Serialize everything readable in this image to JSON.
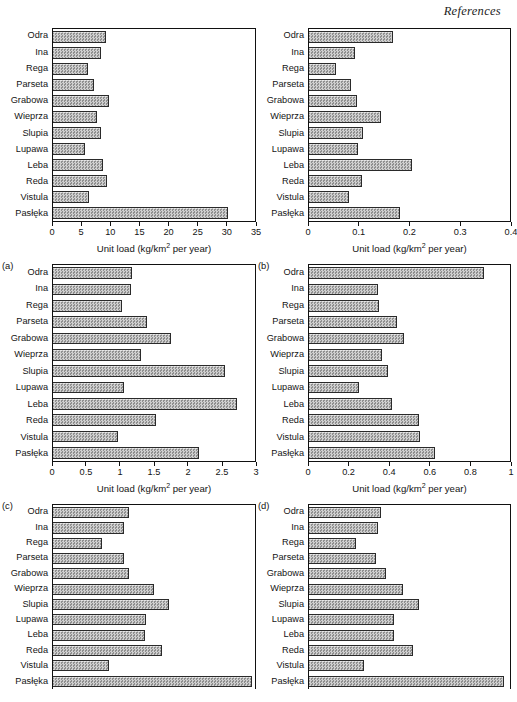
{
  "page": {
    "running_head": "References"
  },
  "common": {
    "categories": [
      "Odra",
      "Ina",
      "Rega",
      "Parseta",
      "Grabowa",
      "Wieprza",
      "Slupia",
      "Lupawa",
      "Leba",
      "Reda",
      "Vistula",
      "Pasłęka"
    ],
    "axis_title_main": "Unit load (kg/km",
    "axis_title_sup": "2",
    "axis_title_tail": " per year)"
  },
  "chart_data": [
    {
      "id": "a",
      "panel_label": "(a)",
      "type": "bar",
      "orientation": "horizontal",
      "title": "",
      "xlabel": "Unit load (kg/km2 per year)",
      "ylabel": "",
      "categories": [
        "Odra",
        "Ina",
        "Rega",
        "Parseta",
        "Grabowa",
        "Wieprza",
        "Slupia",
        "Lupawa",
        "Leba",
        "Reda",
        "Vistula",
        "Pasłęka"
      ],
      "values": [
        9.2,
        8.4,
        6.0,
        7.1,
        9.7,
        7.6,
        8.4,
        5.6,
        8.6,
        9.3,
        6.3,
        30.3
      ],
      "xlim": [
        0,
        35
      ],
      "ticks": [
        0,
        5,
        10,
        15,
        20,
        25,
        30,
        35
      ],
      "ticklabels": [
        "0",
        "5",
        "10",
        "15",
        "20",
        "25",
        "30",
        "35"
      ],
      "grid": false,
      "clipped": false
    },
    {
      "id": "b",
      "panel_label": "(b)",
      "type": "bar",
      "orientation": "horizontal",
      "title": "",
      "xlabel": "Unit load (kg/km2 per year)",
      "ylabel": "",
      "categories": [
        "Odra",
        "Ina",
        "Rega",
        "Parseta",
        "Grabowa",
        "Wieprza",
        "Slupia",
        "Lupawa",
        "Leba",
        "Reda",
        "Vistula",
        "Pasłęka"
      ],
      "values": [
        0.168,
        0.091,
        0.053,
        0.084,
        0.095,
        0.143,
        0.107,
        0.098,
        0.204,
        0.106,
        0.08,
        0.181
      ],
      "xlim": [
        0,
        0.4
      ],
      "ticks": [
        0,
        0.1,
        0.2,
        0.3,
        0.4
      ],
      "ticklabels": [
        "0",
        "0.1",
        "0.2",
        "0.3",
        "0.4"
      ],
      "grid": false,
      "clipped": false
    },
    {
      "id": "c",
      "panel_label": "(c)",
      "type": "bar",
      "orientation": "horizontal",
      "title": "",
      "xlabel": "Unit load (kg/km2 per year)",
      "ylabel": "",
      "categories": [
        "Odra",
        "Ina",
        "Rega",
        "Parseta",
        "Grabowa",
        "Wieprza",
        "Slupia",
        "Lupawa",
        "Leba",
        "Reda",
        "Vistula",
        "Pasłęka"
      ],
      "values": [
        1.18,
        1.16,
        1.02,
        1.4,
        1.75,
        1.3,
        2.55,
        1.06,
        2.73,
        1.53,
        0.97,
        2.17
      ],
      "xlim": [
        0,
        3
      ],
      "ticks": [
        0,
        0.5,
        1,
        1.5,
        2,
        2.5,
        3
      ],
      "ticklabels": [
        "0",
        "0.5",
        "1",
        "1.5",
        "2",
        "2.5",
        "3"
      ],
      "grid": false,
      "clipped": false
    },
    {
      "id": "d",
      "panel_label": "(d)",
      "type": "bar",
      "orientation": "horizontal",
      "title": "",
      "xlabel": "Unit load (kg/km2 per year)",
      "ylabel": "",
      "categories": [
        "Odra",
        "Ina",
        "Rega",
        "Parseta",
        "Grabowa",
        "Wieprza",
        "Slupia",
        "Lupawa",
        "Leba",
        "Reda",
        "Vistula",
        "Pasłęka"
      ],
      "values": [
        0.87,
        0.345,
        0.35,
        0.44,
        0.475,
        0.365,
        0.395,
        0.25,
        0.415,
        0.545,
        0.55,
        0.625
      ],
      "xlim": [
        0,
        1
      ],
      "ticks": [
        0,
        0.2,
        0.4,
        0.6,
        0.8,
        1
      ],
      "ticklabels": [
        "0",
        "0.2",
        "0.4",
        "0.6",
        "0.8",
        "1"
      ],
      "grid": false,
      "clipped": false
    },
    {
      "id": "e",
      "panel_label": "",
      "type": "bar",
      "orientation": "horizontal",
      "title": "",
      "xlabel": "",
      "ylabel": "",
      "categories": [
        "Odra",
        "Ina",
        "Rega",
        "Parseta",
        "Grabowa",
        "Wieprza",
        "Slupia",
        "Lupawa",
        "Leba",
        "Reda",
        "Vistula",
        "Pasłęka"
      ],
      "values": [
        0.375,
        0.35,
        0.245,
        0.35,
        0.375,
        0.5,
        0.575,
        0.46,
        0.455,
        0.54,
        0.275,
        0.985
      ],
      "xlim": [
        0,
        1
      ],
      "ticks": [],
      "ticklabels": [],
      "grid": false,
      "clipped": true
    },
    {
      "id": "f",
      "panel_label": "",
      "type": "bar",
      "orientation": "horizontal",
      "title": "",
      "xlabel": "",
      "ylabel": "",
      "categories": [
        "Odra",
        "Ina",
        "Rega",
        "Parseta",
        "Grabowa",
        "Wieprza",
        "Slupia",
        "Lupawa",
        "Leba",
        "Reda",
        "Vistula",
        "Pasłęka"
      ],
      "values": [
        0.36,
        0.345,
        0.235,
        0.335,
        0.385,
        0.47,
        0.545,
        0.425,
        0.425,
        0.515,
        0.275,
        0.97
      ],
      "xlim": [
        0,
        1
      ],
      "ticks": [],
      "ticklabels": [],
      "grid": false,
      "clipped": true
    }
  ]
}
